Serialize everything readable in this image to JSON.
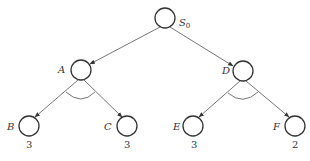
{
  "diagram": {
    "type": "and-or tree",
    "nodes": [
      {
        "id": "S0",
        "label": "S",
        "subscript": "0",
        "x": 165,
        "y": 18
      },
      {
        "id": "A",
        "label": "A",
        "x": 81,
        "y": 70
      },
      {
        "id": "D",
        "label": "D",
        "x": 243,
        "y": 71
      },
      {
        "id": "B",
        "label": "B",
        "x": 29,
        "y": 126,
        "value": "3"
      },
      {
        "id": "C",
        "label": "C",
        "x": 127,
        "y": 126,
        "value": "3"
      },
      {
        "id": "E",
        "label": "E",
        "x": 193,
        "y": 126,
        "value": "3"
      },
      {
        "id": "F",
        "label": "F",
        "x": 295,
        "y": 126,
        "value": "2"
      }
    ],
    "edges": [
      {
        "from": "S0",
        "to": "A"
      },
      {
        "from": "S0",
        "to": "D"
      },
      {
        "from": "A",
        "to": "B"
      },
      {
        "from": "A",
        "to": "C"
      },
      {
        "from": "D",
        "to": "E"
      },
      {
        "from": "D",
        "to": "F"
      }
    ],
    "and_arcs": [
      "A",
      "D"
    ]
  }
}
